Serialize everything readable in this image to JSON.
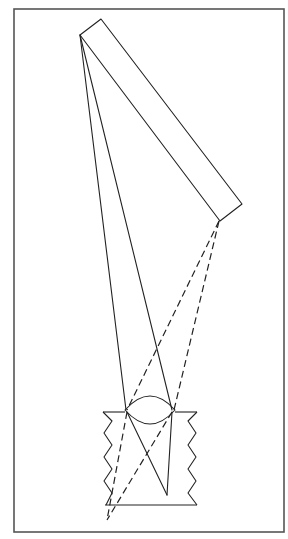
{
  "diagram": {
    "type": "optics-ray-diagram",
    "colors": {
      "stroke": "#222222",
      "frame": "#555555",
      "background": "#ffffff"
    },
    "frame": {
      "x": 14,
      "y": 9,
      "width": 270,
      "height": 523
    },
    "object_rectangle": {
      "points": [
        [
          80,
          35
        ],
        [
          101,
          19
        ],
        [
          242,
          204
        ],
        [
          220,
          221
        ]
      ]
    },
    "lens": {
      "left": [
        125,
        410
      ],
      "right": [
        175,
        410
      ],
      "top_y": 396,
      "bottom_y": 424
    },
    "walls": {
      "top_line_y": 412,
      "bottom_line_y": 505,
      "left_x_range": [
        103,
        113
      ],
      "right_x_range": [
        188,
        197
      ]
    },
    "solid_rays": {
      "source": [
        80,
        35
      ],
      "lens_points": [
        [
          126,
          410
        ],
        [
          172,
          410
        ]
      ],
      "image_point": [
        167,
        495
      ]
    },
    "dashed_rays": {
      "source": [
        219,
        221
      ],
      "lens_points": [
        [
          127,
          410
        ],
        [
          174,
          410
        ]
      ],
      "image_point": [
        107,
        520
      ]
    }
  }
}
